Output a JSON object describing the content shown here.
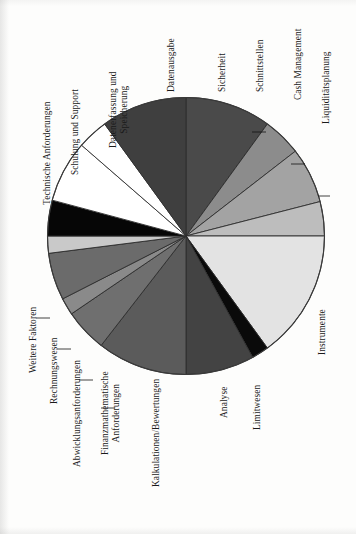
{
  "figure": {
    "orientation": "rotated-90-clockwise",
    "background_color": "#fdfdfc",
    "outline_color": "#3a3a3a"
  },
  "chart_data": {
    "type": "pie",
    "title": "",
    "subtitle": "",
    "xlabel": "",
    "ylabel": "",
    "grid": false,
    "legend_position": "none",
    "labels_outside": true,
    "start_angle_deg": 90,
    "direction": "clockwise",
    "categories": [
      "Datenausgabe",
      "Sicherheit",
      "Schnittstellen",
      "Cash Management",
      "Liquiditätsplanung",
      "Instrumente",
      "Limitwesen",
      "Analyse",
      "Kalkulationen/Bewertungen",
      "Finanzmathematische Anforderungen",
      "Abwicklungsanforderungen",
      "Rechnungswesen",
      "Weitere Faktoren",
      "Technische Anforderungen",
      "Schulung und Support",
      "Datenerfassung und Speicherung"
    ],
    "values": [
      7.5,
      10.0,
      4.5,
      6.5,
      8.5,
      15.0,
      2.0,
      5.0,
      10.5,
      5.0,
      2.0,
      5.5,
      5.5,
      2.0,
      5.5,
      4.5
    ],
    "unit": "%",
    "slices": [
      {
        "label": "Sicherheit",
        "value": 10.0,
        "color": "#4a4a4a",
        "start_deg": 0.0,
        "end_deg": 36.0
      },
      {
        "label": "Schnittstellen",
        "value": 4.5,
        "color": "#8c8c8c",
        "start_deg": 36.0,
        "end_deg": 52.2
      },
      {
        "label": "Cash Management",
        "value": 6.5,
        "color": "#a3a3a3",
        "start_deg": 52.2,
        "end_deg": 75.6
      },
      {
        "label": "Liquiditätsplanung",
        "value": 8.5,
        "color": "#bdbdbd",
        "start_deg": 75.6,
        "end_deg": 90.0
      },
      {
        "label": "Instrumente",
        "value": 15.0,
        "color": "#e3e3e3",
        "start_deg": 90.0,
        "end_deg": 144.0
      },
      {
        "label": "Limitwesen",
        "value": 2.0,
        "color": "#0a0a0a",
        "start_deg": 144.0,
        "end_deg": 151.2
      },
      {
        "label": "Analyse",
        "value": 5.0,
        "color": "#434343",
        "start_deg": 151.2,
        "end_deg": 180.0
      },
      {
        "label": "Kalkulationen/Bewertungen",
        "value": 10.5,
        "color": "#5b5b5b",
        "start_deg": 180.0,
        "end_deg": 217.8
      },
      {
        "label": "Finanzmathematische Anforderungen",
        "value": 5.0,
        "color": "#6f6f6f",
        "start_deg": 217.8,
        "end_deg": 235.8
      },
      {
        "label": "Abwicklungsanforderungen",
        "value": 2.0,
        "color": "#8a8a8a",
        "start_deg": 235.8,
        "end_deg": 243.0
      },
      {
        "label": "Rechnungswesen",
        "value": 5.5,
        "color": "#6b6b6b",
        "start_deg": 243.0,
        "end_deg": 262.8
      },
      {
        "label": "Weitere Faktoren",
        "value": 5.5,
        "color": "#c9c9c9",
        "start_deg": 262.8,
        "end_deg": 270.0
      },
      {
        "label": "Technische Anforderungen",
        "value": 2.0,
        "color": "#060606",
        "start_deg": 270.0,
        "end_deg": 285.0
      },
      {
        "label": "Schulung und Support",
        "value": 5.5,
        "color": "#ffffff",
        "start_deg": 285.0,
        "end_deg": 311.0
      },
      {
        "label": "Datenerfassung und Speicherung",
        "value": 4.5,
        "color": "#ffffff",
        "start_deg": 311.0,
        "end_deg": 324.0
      },
      {
        "label": "Datenausgabe",
        "value": 7.5,
        "color": "#3f3f3f",
        "start_deg": 324.0,
        "end_deg": 360.0
      }
    ]
  },
  "labels": {
    "datenausgabe": "Datenausgabe",
    "sicherheit": "Sicherheit",
    "schnittstellen": "Schnittstellen",
    "cash_management": "Cash Management",
    "liquiditaetsplanung": "Liquiditätsplanung",
    "instrumente": "Instrumente",
    "limitwesen": "Limitwesen",
    "analyse": "Analyse",
    "kalkulationen": "Kalkulationen/Bewertungen",
    "finanzmathematische_1": "Finanzmathematische",
    "finanzmathematische_2": "Anforderungen",
    "abwicklungsanforderungen": "Abwicklungsanforderungen",
    "rechnungswesen": "Rechnungswesen",
    "weitere_faktoren": "Weitere Faktoren",
    "technische_anforderungen": "Technische Anforderungen",
    "schulung_support": "Schulung und Support",
    "datenerfassung_1": "Datenerfassung und",
    "datenerfassung_2": "Speicherung"
  }
}
